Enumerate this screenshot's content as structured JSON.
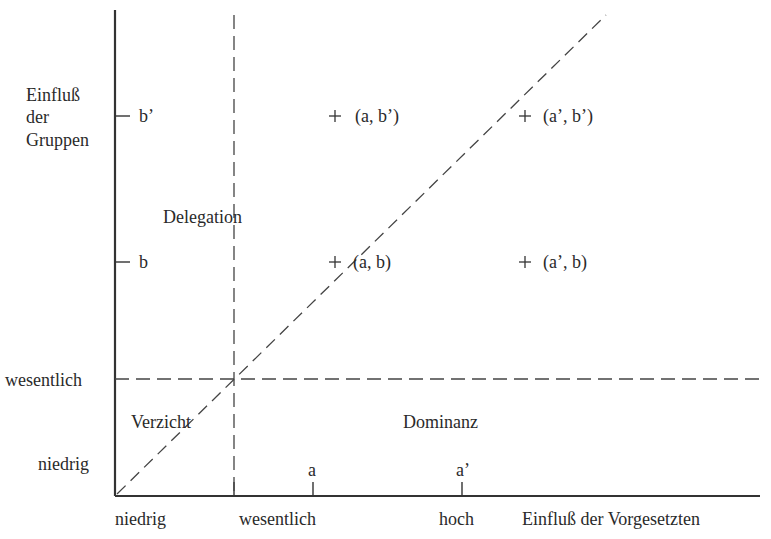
{
  "diagram": {
    "y_axis": {
      "title_lines": [
        "Einfluß",
        "der",
        "Gruppen"
      ],
      "levels": [
        "niedrig",
        "wesentlich"
      ],
      "ticks": [
        "b",
        "b’"
      ]
    },
    "x_axis": {
      "title": "Einfluß der Vorgesetzten",
      "levels": [
        "niedrig",
        "wesentlich",
        "hoch"
      ],
      "ticks": [
        "a",
        "a’"
      ]
    },
    "regions": {
      "delegation": "Delegation",
      "verzicht": "Verzicht",
      "dominanz": "Dominanz"
    },
    "points": [
      {
        "marker": "+",
        "label": "(a, b’)"
      },
      {
        "marker": "+",
        "label": "(a’, b’)"
      },
      {
        "marker": "+",
        "label": "(a, b)"
      },
      {
        "marker": "+",
        "label": "(a’, b)"
      }
    ]
  }
}
